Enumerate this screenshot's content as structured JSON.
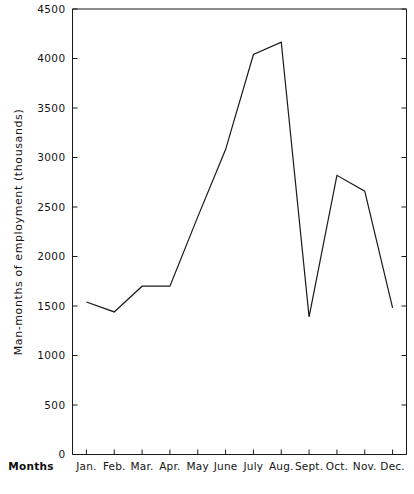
{
  "chart_data": {
    "type": "line",
    "title": "",
    "subtitle": "",
    "xlabel": "Months",
    "ylabel": "Man-months of employment (thousands)",
    "categories": [
      "Jan.",
      "Feb.",
      "Mar.",
      "Apr.",
      "May",
      "June",
      "July",
      "Aug.",
      "Sept.",
      "Oct.",
      "Nov.",
      "Dec."
    ],
    "values": [
      1540,
      1440,
      1700,
      1700,
      2400,
      3080,
      4040,
      4165,
      1390,
      2820,
      2660,
      1480
    ],
    "series": [
      {
        "name": "Man-months of employment",
        "values": [
          1540,
          1440,
          1700,
          1700,
          2400,
          3080,
          4040,
          4165,
          1390,
          2820,
          2660,
          1480
        ]
      }
    ],
    "ylim": [
      0,
      4500
    ],
    "yticks": [
      0,
      500,
      1000,
      1500,
      2000,
      2500,
      3000,
      3500,
      4000,
      4500
    ],
    "ytick_labels": [
      "0",
      "500",
      "1000",
      "1500",
      "2000",
      "2500",
      "3000",
      "3500",
      "4000",
      "4500"
    ],
    "grid": false,
    "legend": "none",
    "line_color": "#1a1a1a",
    "background_color": "#ffffff",
    "annotations": []
  }
}
